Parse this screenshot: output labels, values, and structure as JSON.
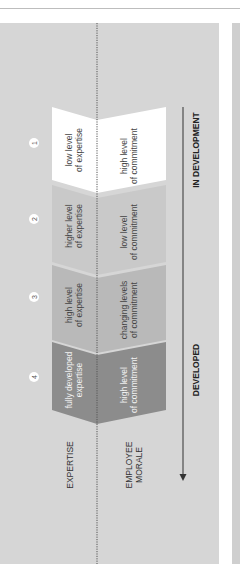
{
  "diagram": {
    "orientation": "rotated-90-clockwise",
    "row_labels": {
      "expertise": "EXPERTISE",
      "morale_line1": "EMPLOYEE",
      "morale_line2": "MORALE"
    },
    "axis": {
      "start_label": "IN DEVELOPMENT",
      "end_label": "DEVELOPED"
    },
    "stages": [
      {
        "number": "1",
        "expertise_line1": "low level",
        "expertise_line2": "of expertise",
        "morale_line1": "high level",
        "morale_line2": "of commitment",
        "color": "#ffffff"
      },
      {
        "number": "2",
        "expertise_line1": "higher level",
        "expertise_line2": "of expertise",
        "morale_line1": "low level",
        "morale_line2": "of commitment",
        "color": "#c9c9c9"
      },
      {
        "number": "3",
        "expertise_line1": "high level",
        "expertise_line2": "of expertise",
        "morale_line1": "changing levels",
        "morale_line2": "of commitment",
        "color": "#b9b9b9"
      },
      {
        "number": "4",
        "expertise_line1": "fully developed",
        "expertise_line2": "expertise",
        "morale_line1": "high level",
        "morale_line2": "of commitment",
        "color": "#8c8c8c"
      }
    ],
    "colors": {
      "panel_bg": "#d6d6d6",
      "text_dark": "#444444",
      "text_light": "#f2f2f2"
    }
  }
}
